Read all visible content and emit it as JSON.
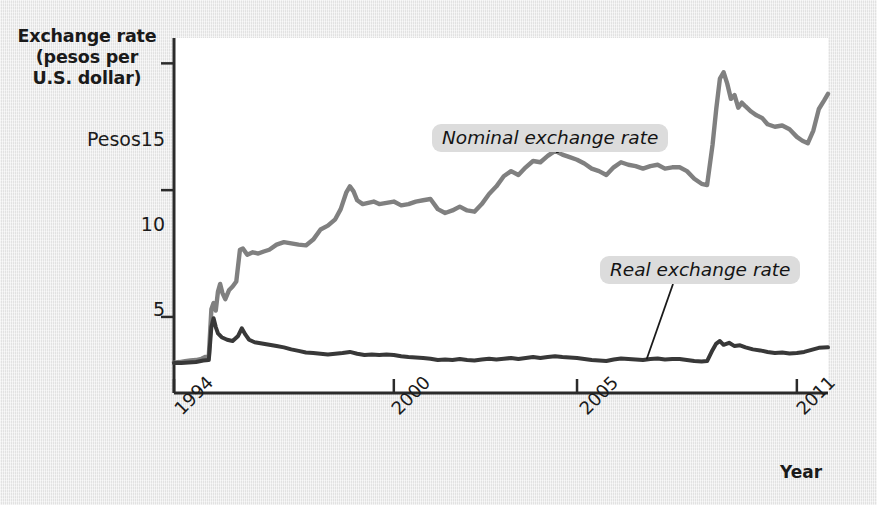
{
  "figure": {
    "background_color": "#e9e9e9",
    "plot_background_color": "#ffffff",
    "axis_color": "#2b2b2b"
  },
  "axes": {
    "y_title_line1": "Exchange rate",
    "y_title_line2": "(pesos per",
    "y_title_line3": "U.S. dollar)",
    "y_ticks": [
      {
        "label": "Pesos15",
        "value": 15
      },
      {
        "label": "10",
        "value": 10
      },
      {
        "label": "5",
        "value": 5
      }
    ],
    "x_ticks": [
      {
        "label": "1994",
        "value": 1994
      },
      {
        "label": "2000",
        "value": 2000
      },
      {
        "label": "2005",
        "value": 2005
      },
      {
        "label": "2011",
        "value": 2011
      }
    ],
    "x_caption": "Year"
  },
  "series_labels": {
    "nominal": "Nominal exchange rate",
    "real": "Real exchange rate"
  },
  "chart_data": {
    "type": "line",
    "title": "",
    "xlabel": "Year",
    "ylabel": "Exchange rate (pesos per U.S. dollar)",
    "xlim": [
      1994.0,
      2011.85
    ],
    "ylim": [
      2.0,
      16.0
    ],
    "yticks": [
      5,
      10,
      15
    ],
    "xticks": [
      1994,
      2000,
      2005,
      2011
    ],
    "grid": false,
    "legend": "inline-annotations",
    "colors": {
      "nominal": "#808080",
      "real": "#383838"
    },
    "series": [
      {
        "name": "Nominal exchange rate",
        "color": "#808080",
        "points": [
          [
            1994.0,
            3.2
          ],
          [
            1994.15,
            3.22
          ],
          [
            1994.3,
            3.25
          ],
          [
            1994.45,
            3.28
          ],
          [
            1994.6,
            3.3
          ],
          [
            1994.75,
            3.35
          ],
          [
            1994.85,
            3.42
          ],
          [
            1994.95,
            3.45
          ],
          [
            1995.02,
            5.3
          ],
          [
            1995.08,
            5.55
          ],
          [
            1995.14,
            5.25
          ],
          [
            1995.2,
            6.0
          ],
          [
            1995.26,
            6.3
          ],
          [
            1995.32,
            5.95
          ],
          [
            1995.4,
            5.7
          ],
          [
            1995.5,
            6.05
          ],
          [
            1995.6,
            6.2
          ],
          [
            1995.7,
            6.4
          ],
          [
            1995.8,
            7.65
          ],
          [
            1995.88,
            7.7
          ],
          [
            1996.0,
            7.45
          ],
          [
            1996.15,
            7.55
          ],
          [
            1996.3,
            7.5
          ],
          [
            1996.45,
            7.58
          ],
          [
            1996.6,
            7.65
          ],
          [
            1996.8,
            7.85
          ],
          [
            1997.0,
            7.95
          ],
          [
            1997.2,
            7.9
          ],
          [
            1997.4,
            7.85
          ],
          [
            1997.6,
            7.82
          ],
          [
            1997.8,
            8.05
          ],
          [
            1998.0,
            8.45
          ],
          [
            1998.2,
            8.6
          ],
          [
            1998.4,
            8.85
          ],
          [
            1998.55,
            9.25
          ],
          [
            1998.7,
            9.9
          ],
          [
            1998.8,
            10.15
          ],
          [
            1998.9,
            9.95
          ],
          [
            1999.0,
            9.6
          ],
          [
            1999.15,
            9.45
          ],
          [
            1999.3,
            9.5
          ],
          [
            1999.45,
            9.55
          ],
          [
            1999.6,
            9.45
          ],
          [
            1999.8,
            9.5
          ],
          [
            2000.0,
            9.55
          ],
          [
            2000.2,
            9.4
          ],
          [
            2000.4,
            9.45
          ],
          [
            2000.6,
            9.55
          ],
          [
            2000.8,
            9.6
          ],
          [
            2001.0,
            9.65
          ],
          [
            2001.2,
            9.25
          ],
          [
            2001.4,
            9.1
          ],
          [
            2001.6,
            9.2
          ],
          [
            2001.8,
            9.35
          ],
          [
            2002.0,
            9.2
          ],
          [
            2002.2,
            9.15
          ],
          [
            2002.4,
            9.45
          ],
          [
            2002.6,
            9.85
          ],
          [
            2002.8,
            10.15
          ],
          [
            2003.0,
            10.55
          ],
          [
            2003.2,
            10.75
          ],
          [
            2003.4,
            10.6
          ],
          [
            2003.6,
            10.9
          ],
          [
            2003.8,
            11.15
          ],
          [
            2004.0,
            11.1
          ],
          [
            2004.2,
            11.35
          ],
          [
            2004.4,
            11.55
          ],
          [
            2004.6,
            11.4
          ],
          [
            2004.8,
            11.3
          ],
          [
            2005.0,
            11.2
          ],
          [
            2005.2,
            11.05
          ],
          [
            2005.4,
            10.85
          ],
          [
            2005.6,
            10.75
          ],
          [
            2005.8,
            10.6
          ],
          [
            2006.0,
            10.9
          ],
          [
            2006.2,
            11.1
          ],
          [
            2006.4,
            11.0
          ],
          [
            2006.6,
            10.95
          ],
          [
            2006.8,
            10.85
          ],
          [
            2007.0,
            10.95
          ],
          [
            2007.2,
            11.0
          ],
          [
            2007.4,
            10.85
          ],
          [
            2007.6,
            10.9
          ],
          [
            2007.8,
            10.9
          ],
          [
            2008.0,
            10.75
          ],
          [
            2008.2,
            10.45
          ],
          [
            2008.4,
            10.25
          ],
          [
            2008.55,
            10.2
          ],
          [
            2008.7,
            11.8
          ],
          [
            2008.8,
            13.2
          ],
          [
            2008.9,
            14.4
          ],
          [
            2009.0,
            14.65
          ],
          [
            2009.1,
            14.2
          ],
          [
            2009.2,
            13.6
          ],
          [
            2009.3,
            13.75
          ],
          [
            2009.4,
            13.25
          ],
          [
            2009.5,
            13.45
          ],
          [
            2009.6,
            13.3
          ],
          [
            2009.75,
            13.1
          ],
          [
            2009.9,
            12.95
          ],
          [
            2010.05,
            12.85
          ],
          [
            2010.2,
            12.6
          ],
          [
            2010.4,
            12.5
          ],
          [
            2010.6,
            12.55
          ],
          [
            2010.8,
            12.4
          ],
          [
            2011.0,
            12.1
          ],
          [
            2011.15,
            11.95
          ],
          [
            2011.3,
            11.85
          ],
          [
            2011.45,
            12.35
          ],
          [
            2011.6,
            13.2
          ],
          [
            2011.75,
            13.55
          ],
          [
            2011.85,
            13.8
          ]
        ]
      },
      {
        "name": "Real exchange rate",
        "color": "#383838",
        "points": [
          [
            1994.0,
            3.18
          ],
          [
            1994.2,
            3.18
          ],
          [
            1994.4,
            3.2
          ],
          [
            1994.6,
            3.22
          ],
          [
            1994.8,
            3.28
          ],
          [
            1994.95,
            3.3
          ],
          [
            1995.02,
            4.6
          ],
          [
            1995.08,
            4.95
          ],
          [
            1995.14,
            4.6
          ],
          [
            1995.2,
            4.35
          ],
          [
            1995.3,
            4.2
          ],
          [
            1995.45,
            4.1
          ],
          [
            1995.6,
            4.05
          ],
          [
            1995.75,
            4.25
          ],
          [
            1995.85,
            4.55
          ],
          [
            1995.95,
            4.3
          ],
          [
            1996.05,
            4.1
          ],
          [
            1996.2,
            4.0
          ],
          [
            1996.4,
            3.95
          ],
          [
            1996.6,
            3.9
          ],
          [
            1996.8,
            3.85
          ],
          [
            1997.0,
            3.8
          ],
          [
            1997.2,
            3.72
          ],
          [
            1997.4,
            3.66
          ],
          [
            1997.6,
            3.6
          ],
          [
            1997.8,
            3.58
          ],
          [
            1998.0,
            3.55
          ],
          [
            1998.2,
            3.52
          ],
          [
            1998.4,
            3.55
          ],
          [
            1998.6,
            3.58
          ],
          [
            1998.8,
            3.62
          ],
          [
            1999.0,
            3.55
          ],
          [
            1999.2,
            3.5
          ],
          [
            1999.4,
            3.52
          ],
          [
            1999.6,
            3.5
          ],
          [
            1999.8,
            3.52
          ],
          [
            2000.0,
            3.5
          ],
          [
            2000.2,
            3.45
          ],
          [
            2000.4,
            3.42
          ],
          [
            2000.6,
            3.4
          ],
          [
            2000.8,
            3.38
          ],
          [
            2001.0,
            3.35
          ],
          [
            2001.2,
            3.3
          ],
          [
            2001.4,
            3.32
          ],
          [
            2001.6,
            3.3
          ],
          [
            2001.8,
            3.34
          ],
          [
            2002.0,
            3.3
          ],
          [
            2002.2,
            3.28
          ],
          [
            2002.4,
            3.32
          ],
          [
            2002.6,
            3.35
          ],
          [
            2002.8,
            3.32
          ],
          [
            2003.0,
            3.35
          ],
          [
            2003.2,
            3.38
          ],
          [
            2003.4,
            3.34
          ],
          [
            2003.6,
            3.38
          ],
          [
            2003.8,
            3.42
          ],
          [
            2004.0,
            3.38
          ],
          [
            2004.2,
            3.42
          ],
          [
            2004.4,
            3.45
          ],
          [
            2004.6,
            3.42
          ],
          [
            2004.8,
            3.4
          ],
          [
            2005.0,
            3.38
          ],
          [
            2005.2,
            3.34
          ],
          [
            2005.4,
            3.3
          ],
          [
            2005.6,
            3.28
          ],
          [
            2005.8,
            3.26
          ],
          [
            2006.0,
            3.32
          ],
          [
            2006.2,
            3.36
          ],
          [
            2006.4,
            3.34
          ],
          [
            2006.6,
            3.32
          ],
          [
            2006.8,
            3.3
          ],
          [
            2007.0,
            3.34
          ],
          [
            2007.2,
            3.36
          ],
          [
            2007.4,
            3.32
          ],
          [
            2007.6,
            3.34
          ],
          [
            2007.8,
            3.34
          ],
          [
            2008.0,
            3.3
          ],
          [
            2008.2,
            3.26
          ],
          [
            2008.4,
            3.24
          ],
          [
            2008.55,
            3.26
          ],
          [
            2008.7,
            3.7
          ],
          [
            2008.8,
            3.95
          ],
          [
            2008.9,
            4.05
          ],
          [
            2009.0,
            3.9
          ],
          [
            2009.15,
            3.98
          ],
          [
            2009.3,
            3.85
          ],
          [
            2009.45,
            3.88
          ],
          [
            2009.6,
            3.8
          ],
          [
            2009.8,
            3.72
          ],
          [
            2010.0,
            3.68
          ],
          [
            2010.2,
            3.62
          ],
          [
            2010.4,
            3.58
          ],
          [
            2010.6,
            3.6
          ],
          [
            2010.8,
            3.56
          ],
          [
            2011.0,
            3.58
          ],
          [
            2011.2,
            3.62
          ],
          [
            2011.4,
            3.7
          ],
          [
            2011.6,
            3.78
          ],
          [
            2011.85,
            3.8
          ]
        ]
      }
    ],
    "annotations": [
      {
        "text": "Nominal exchange rate",
        "points_to_year": 2004.5,
        "points_to_value": 11.5
      },
      {
        "text": "Real exchange rate",
        "points_to_year": 2006.9,
        "points_to_value": 3.33
      }
    ]
  }
}
